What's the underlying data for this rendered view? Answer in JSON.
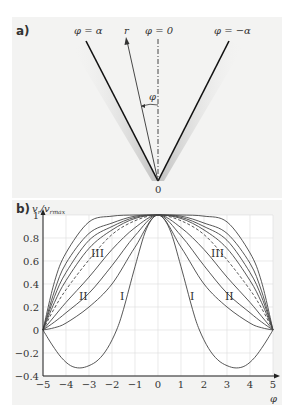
{
  "panel_a": {
    "label": "a)",
    "phi_alpha": "φ = α",
    "phi_zero": "φ = 0",
    "phi_neg_alpha": "φ = −α",
    "r_label": "r",
    "phi_label": "φ",
    "origin_label": "0"
  },
  "panel_b": {
    "label": "b)",
    "ylabel_main": "v",
    "ylabel_sub1": "r",
    "ylabel_mid": "/v",
    "ylabel_sub2": "rmax",
    "xlabel": "φ",
    "curve_labels": [
      "III",
      "II",
      "I",
      "I",
      "II",
      "III"
    ]
  },
  "chart_data": {
    "type": "line",
    "title": "",
    "xlabel": "φ",
    "ylabel": "v_r/v_rmax",
    "xlim": [
      -5,
      5
    ],
    "ylim": [
      -0.4,
      1
    ],
    "xticks": [
      -5,
      -4,
      -3,
      -2,
      -1,
      0,
      1,
      2,
      3,
      4,
      5
    ],
    "yticks": [
      -0.4,
      -0.2,
      0,
      0.2,
      0.4,
      0.6,
      0.8,
      1
    ],
    "ytick_labels": [
      "−0.4",
      "−0.2",
      "0",
      "0.2",
      "0.4",
      "0.6",
      "0.8",
      "1"
    ],
    "xtick_labels": [
      "−5",
      "−4",
      "−3",
      "−2",
      "−1",
      "0",
      "1",
      "2",
      "3",
      "4",
      "5"
    ],
    "grid": true,
    "x": [
      0,
      1,
      2,
      3,
      4,
      4.5,
      5
    ],
    "symmetric": true,
    "series": [
      {
        "name": "A",
        "style": "solid",
        "values": [
          1,
          1.0,
          0.99,
          0.94,
          0.67,
          0.42,
          0
        ]
      },
      {
        "name": "B",
        "style": "solid",
        "values": [
          1,
          0.99,
          0.93,
          0.84,
          0.58,
          0.34,
          0
        ]
      },
      {
        "name": "III",
        "style": "solid",
        "values": [
          1,
          0.98,
          0.9,
          0.78,
          0.5,
          0.29,
          0
        ]
      },
      {
        "name": "D",
        "style": "solid",
        "values": [
          1,
          0.97,
          0.87,
          0.71,
          0.43,
          0.24,
          0
        ]
      },
      {
        "name": "dashed",
        "style": "dashed",
        "values": [
          1,
          0.95,
          0.83,
          0.61,
          0.35,
          0.19,
          0
        ]
      },
      {
        "name": "II-upper",
        "style": "solid",
        "values": [
          1,
          0.89,
          0.7,
          0.46,
          0.24,
          0.12,
          0
        ]
      },
      {
        "name": "II",
        "style": "solid",
        "values": [
          1,
          0.82,
          0.56,
          0.32,
          0.15,
          0.07,
          0
        ]
      },
      {
        "name": "lowest",
        "style": "solid",
        "values": [
          1,
          0.72,
          0.4,
          0.2,
          0.06,
          0.02,
          0
        ]
      }
    ],
    "curve_I": {
      "name": "I",
      "x": [
        0,
        0.5,
        1,
        1.5,
        1.8,
        2.2,
        2.6,
        3.0,
        3.4,
        3.8,
        4.2,
        4.6,
        5
      ],
      "values": [
        1,
        0.88,
        0.55,
        0.18,
        0,
        -0.16,
        -0.26,
        -0.31,
        -0.33,
        -0.31,
        -0.24,
        -0.13,
        0
      ]
    }
  }
}
